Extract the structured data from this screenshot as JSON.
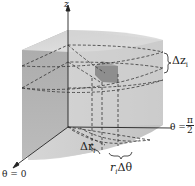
{
  "diagram": {
    "axis_z_label": "z",
    "delta_z_label": "Δz",
    "delta_z_sub": "i",
    "theta_half_pi_label": "θ =",
    "pi_num": "π",
    "pi_den": "2",
    "theta_zero_label": "θ = 0",
    "delta_r_label": "Δr",
    "delta_r_sub": "i",
    "r_dtheta_label_r": "r",
    "r_dtheta_sub": "i",
    "r_dtheta_label_rest": "Δθ"
  },
  "colors": {
    "solid_front": "#b3b3b3",
    "solid_side": "#c8c8c8",
    "solid_top": "#d9d9d9",
    "solid_bottom": "#d4d4d4",
    "element": "#8a8a8a",
    "dash": "#333333"
  }
}
